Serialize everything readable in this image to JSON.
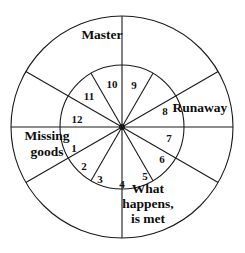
{
  "diagram": {
    "geometry": {
      "center_x": 122,
      "center_y": 127,
      "outer_radius": 111,
      "inner_radius": 62,
      "inner_sector_count": 12,
      "outer_sector_count": 6
    },
    "colors": {
      "stroke": "#1a1a1a",
      "background": "#ffffff",
      "text": "#111111"
    },
    "inner_sectors": [
      {
        "number": "1",
        "x": 74,
        "y": 149
      },
      {
        "number": "2",
        "x": 84,
        "y": 167
      },
      {
        "number": "3",
        "x": 100,
        "y": 180
      },
      {
        "number": "4",
        "x": 122,
        "y": 185
      },
      {
        "number": "5",
        "x": 145,
        "y": 177
      },
      {
        "number": "6",
        "x": 162,
        "y": 160
      },
      {
        "number": "7",
        "x": 169,
        "y": 139
      },
      {
        "number": "8",
        "x": 165,
        "y": 112
      },
      {
        "number": "9",
        "x": 134,
        "y": 86
      },
      {
        "number": "10",
        "x": 112,
        "y": 85
      },
      {
        "number": "11",
        "x": 89,
        "y": 97
      },
      {
        "number": "12",
        "x": 77,
        "y": 120
      }
    ],
    "outer_labels": [
      {
        "name": "master",
        "lines": [
          "Master"
        ],
        "x": 102,
        "y": 36,
        "line_height": 16
      },
      {
        "name": "runaway",
        "lines": [
          "Runaway"
        ],
        "x": 200,
        "y": 109,
        "line_height": 16
      },
      {
        "name": "missing-goods",
        "lines": [
          "Missing",
          "goods"
        ],
        "x": 47,
        "y": 145,
        "line_height": 16
      },
      {
        "name": "what-happens-is-met",
        "lines": [
          "What",
          "happens,",
          "is met"
        ],
        "x": 148,
        "y": 205,
        "line_height": 15
      }
    ]
  }
}
